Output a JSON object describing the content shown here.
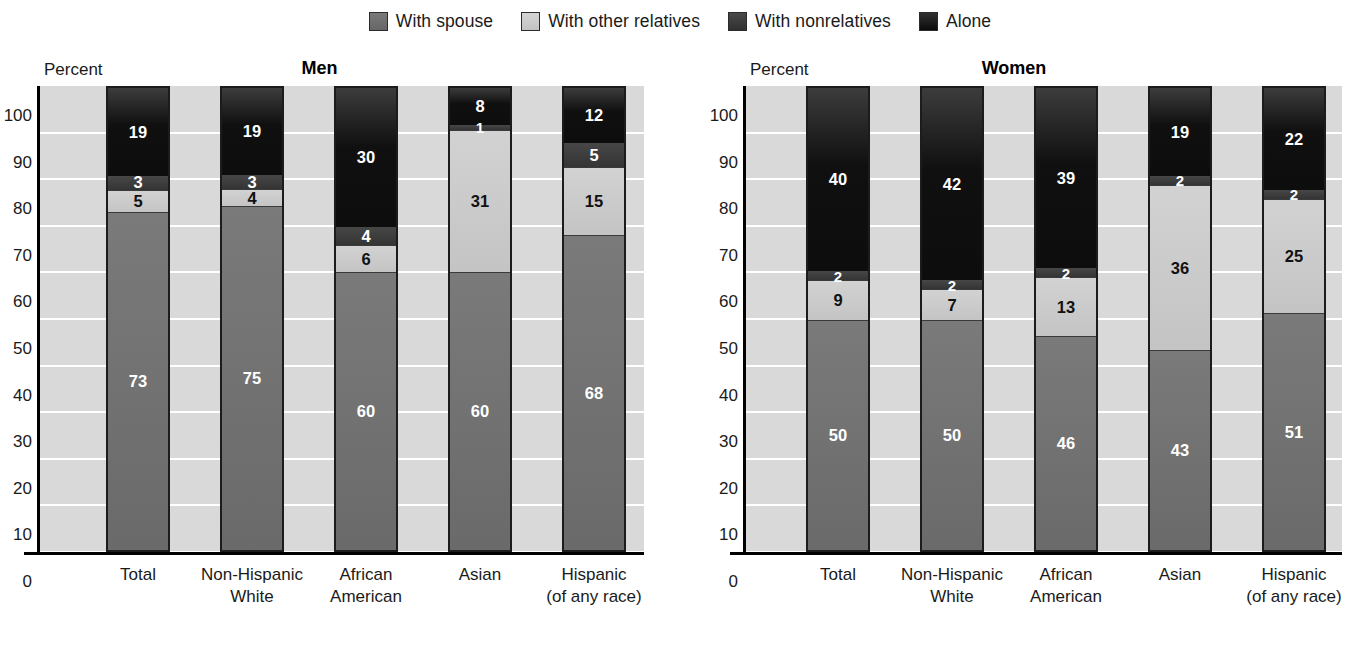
{
  "legend": {
    "items": [
      {
        "label": "With spouse",
        "key": "spouse",
        "color": "#6e6e6e",
        "icon": "legend-swatch-icon"
      },
      {
        "label": "With other relatives",
        "key": "relatives",
        "color": "#c8c8c8",
        "icon": "legend-swatch-icon"
      },
      {
        "label": "With nonrelatives",
        "key": "nonrelatives",
        "color": "#3a3a3a",
        "icon": "legend-swatch-icon"
      },
      {
        "label": "Alone",
        "key": "alone",
        "color": "#141414",
        "icon": "legend-swatch-icon"
      }
    ]
  },
  "panels": [
    {
      "title": "Men",
      "axis_caption": "Percent"
    },
    {
      "title": "Women",
      "axis_caption": "Percent"
    }
  ],
  "yticks": [
    "100",
    "90",
    "80",
    "70",
    "60",
    "50",
    "40",
    "30",
    "20",
    "10",
    "0"
  ],
  "categories": [
    {
      "line1": "Total",
      "line2": ""
    },
    {
      "line1": "Non-Hispanic",
      "line2": "White"
    },
    {
      "line1": "African",
      "line2": "American"
    },
    {
      "line1": "Asian",
      "line2": ""
    },
    {
      "line1": "Hispanic",
      "line2": "(of any race)"
    }
  ],
  "men": {
    "total": {
      "spouse": "73",
      "relatives": "5",
      "nonrelatives": "3",
      "alone": "19"
    },
    "nhwhite": {
      "spouse": "75",
      "relatives": "4",
      "nonrelatives": "3",
      "alone": "19"
    },
    "african": {
      "spouse": "60",
      "relatives": "6",
      "nonrelatives": "4",
      "alone": "30"
    },
    "asian": {
      "spouse": "60",
      "relatives": "31",
      "nonrelatives": "1",
      "alone": "8"
    },
    "hispanic": {
      "spouse": "68",
      "relatives": "15",
      "nonrelatives": "5",
      "alone": "12"
    }
  },
  "women": {
    "total": {
      "spouse": "50",
      "relatives": "9",
      "nonrelatives": "2",
      "alone": "40"
    },
    "nhwhite": {
      "spouse": "50",
      "relatives": "7",
      "nonrelatives": "2",
      "alone": "42"
    },
    "african": {
      "spouse": "46",
      "relatives": "13",
      "nonrelatives": "2",
      "alone": "39"
    },
    "asian": {
      "spouse": "43",
      "relatives": "36",
      "nonrelatives": "2",
      "alone": "19"
    },
    "hispanic": {
      "spouse": "51",
      "relatives": "25",
      "nonrelatives": "2",
      "alone": "22"
    }
  },
  "chart_data": {
    "type": "bar",
    "subtype": "stacked-100-percent",
    "title": "",
    "xlabel": "",
    "ylabel": "Percent",
    "ylim": [
      0,
      100
    ],
    "yticks": [
      0,
      10,
      20,
      30,
      40,
      50,
      60,
      70,
      80,
      90,
      100
    ],
    "grid": true,
    "legend_position": "top-center",
    "legend_entries": [
      "With spouse",
      "With other relatives",
      "With nonrelatives",
      "Alone"
    ],
    "panels": [
      {
        "title": "Men",
        "categories": [
          "Total",
          "Non-Hispanic White",
          "African American",
          "Asian",
          "Hispanic (of any race)"
        ],
        "series": [
          {
            "name": "With spouse",
            "values": [
              73,
              75,
              60,
              60,
              68
            ]
          },
          {
            "name": "With other relatives",
            "values": [
              5,
              4,
              6,
              31,
              15
            ]
          },
          {
            "name": "With nonrelatives",
            "values": [
              3,
              3,
              4,
              1,
              5
            ]
          },
          {
            "name": "Alone",
            "values": [
              19,
              19,
              30,
              8,
              12
            ]
          }
        ]
      },
      {
        "title": "Women",
        "categories": [
          "Total",
          "Non-Hispanic White",
          "African American",
          "Asian",
          "Hispanic (of any race)"
        ],
        "series": [
          {
            "name": "With spouse",
            "values": [
              50,
              50,
              46,
              43,
              51
            ]
          },
          {
            "name": "With other relatives",
            "values": [
              9,
              7,
              13,
              36,
              25
            ]
          },
          {
            "name": "With nonrelatives",
            "values": [
              2,
              2,
              2,
              2,
              2
            ]
          },
          {
            "name": "Alone",
            "values": [
              40,
              42,
              39,
              19,
              22
            ]
          }
        ]
      }
    ]
  }
}
